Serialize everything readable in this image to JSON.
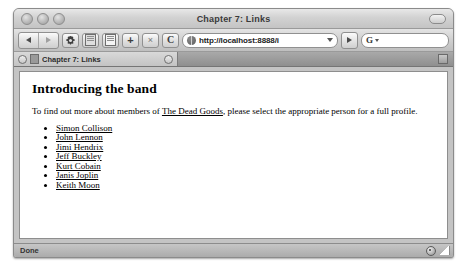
{
  "window": {
    "title": "Chapter 7: Links",
    "traffic_lights": [
      "close",
      "minimize",
      "zoom"
    ],
    "toolbar_toggle": "toolbar-toggle"
  },
  "toolbar": {
    "back_label": "Back",
    "forward_label": "Forward",
    "preferences_label": "Preferences",
    "bookmarks_label": "Bookmarks",
    "history_label": "History",
    "new_tab_label": "+",
    "close_tab_label": "×",
    "reload_label": "C",
    "url_value": "http://localhost:8888/i",
    "url_placeholder": "Enter web address",
    "go_label": "Go",
    "search_engine": "G",
    "search_value": "",
    "search_placeholder": ""
  },
  "tabs": [
    {
      "label": "Chapter 7: Links",
      "active": true
    }
  ],
  "page": {
    "heading": "Introducing the band",
    "paragraph_before": "To find out more about members of ",
    "paragraph_link": "The Dead Goods",
    "paragraph_after": ", please select the appropriate person for a full profile.",
    "members": [
      "Simon Collison",
      "John Lennon",
      "Jimi Hendrix",
      "Jeff Buckley",
      "Kurt Cobain",
      "Janis Joplin",
      "Keith Moon"
    ]
  },
  "status": {
    "text": "Done",
    "security": "lock-icon",
    "resize": "resize-grip"
  },
  "colors": {
    "window_chrome": "#cfcfcf",
    "tab_bar": "#9a9a9a",
    "page_background": "#ffffff",
    "text": "#000000"
  }
}
